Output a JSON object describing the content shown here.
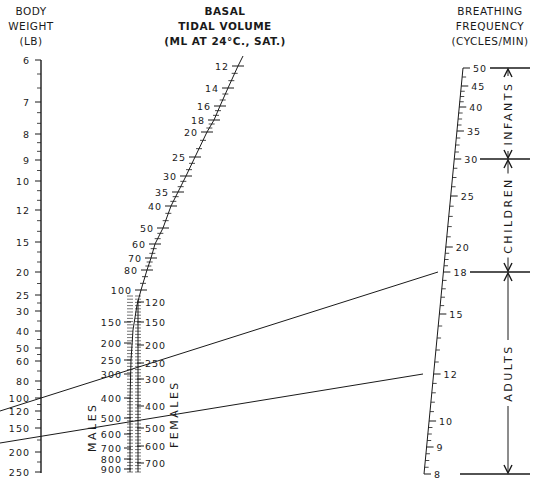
{
  "chart_data": {
    "type": "nomogram",
    "axes": [
      {
        "name": "Body Weight",
        "label_lines": [
          "BODY",
          "WEIGHT",
          "(LB)"
        ],
        "scale": "log",
        "ticks": [
          6,
          7,
          8,
          9,
          10,
          12,
          15,
          20,
          25,
          30,
          40,
          50,
          60,
          80,
          100,
          120,
          150,
          200,
          250
        ]
      },
      {
        "name": "Basal Tidal Volume",
        "label_lines": [
          "BASAL",
          "TIDAL VOLUME",
          "(ML AT 24°C., SAT.)"
        ],
        "scale": "curved",
        "ticks_common": [
          12,
          14,
          16,
          18,
          20,
          25,
          30,
          35,
          40,
          50,
          60,
          70,
          80,
          100
        ],
        "ticks_males": [
          120,
          150,
          200,
          250,
          300,
          400,
          500,
          600,
          700,
          800,
          900
        ],
        "ticks_females": [
          120,
          150,
          200,
          250,
          300,
          400,
          500,
          600,
          700
        ],
        "side_labels": {
          "males": "MALES",
          "females": "FEMALES"
        }
      },
      {
        "name": "Breathing Frequency",
        "label_lines": [
          "BREATHING",
          "FREQUENCY",
          "(CYCLES/MIN)"
        ],
        "scale": "log",
        "ticks": [
          50,
          45,
          40,
          35,
          30,
          25,
          20,
          18,
          15,
          12,
          10,
          9,
          8
        ]
      }
    ],
    "ranges": [
      {
        "label": "INFANTS",
        "from": 30,
        "to": 50
      },
      {
        "label": "CHILDREN",
        "from": 18,
        "to": 30
      },
      {
        "label": "ADULTS",
        "from": 8,
        "to": 18
      }
    ],
    "example_lines": [
      {
        "body_weight_lb": 120,
        "tidal_volume_ml": 300,
        "sex": "females",
        "frequency": 18
      },
      {
        "body_weight_lb": 170,
        "tidal_volume_ml": 550,
        "sex": "males",
        "frequency": 12
      }
    ],
    "grid": false,
    "legend": "none"
  },
  "headers": {
    "weight": [
      "BODY",
      "WEIGHT",
      "(LB)"
    ],
    "tidal": [
      "BASAL",
      "TIDAL VOLUME",
      "(ML AT 24°C., SAT.)"
    ],
    "freq": [
      "BREATHING",
      "FREQUENCY",
      "(CYCLES/MIN)"
    ]
  },
  "weight_ticks": [
    {
      "v": "6",
      "y": 60
    },
    {
      "v": "7",
      "y": 102
    },
    {
      "v": "8",
      "y": 134
    },
    {
      "v": "9",
      "y": 160
    },
    {
      "v": "10",
      "y": 181
    },
    {
      "v": "12",
      "y": 210
    },
    {
      "v": "15",
      "y": 242
    },
    {
      "v": "20",
      "y": 272
    },
    {
      "v": "25",
      "y": 295
    },
    {
      "v": "30",
      "y": 311
    },
    {
      "v": "40",
      "y": 331
    },
    {
      "v": "50",
      "y": 348
    },
    {
      "v": "60",
      "y": 361
    },
    {
      "v": "80",
      "y": 381
    },
    {
      "v": "100",
      "y": 398
    },
    {
      "v": "120",
      "y": 411
    },
    {
      "v": "150",
      "y": 428
    },
    {
      "v": "200",
      "y": 452
    },
    {
      "v": "250",
      "y": 472
    }
  ],
  "tidal_common_ticks": [
    {
      "v": "12",
      "x": 238,
      "y": 66
    },
    {
      "v": "14",
      "x": 228,
      "y": 88
    },
    {
      "v": "16",
      "x": 220,
      "y": 106
    },
    {
      "v": "18",
      "x": 214,
      "y": 120
    },
    {
      "v": "20",
      "x": 207,
      "y": 132
    },
    {
      "v": "25",
      "x": 195,
      "y": 157
    },
    {
      "v": "30",
      "x": 186,
      "y": 176
    },
    {
      "v": "35",
      "x": 178,
      "y": 192
    },
    {
      "v": "40",
      "x": 171,
      "y": 206
    },
    {
      "v": "50",
      "x": 163,
      "y": 228
    },
    {
      "v": "60",
      "x": 155,
      "y": 244
    },
    {
      "v": "70",
      "x": 151,
      "y": 258
    },
    {
      "v": "80",
      "x": 147,
      "y": 270
    },
    {
      "v": "100",
      "x": 141,
      "y": 290
    }
  ],
  "tidal_male_ticks": [
    {
      "v": "150",
      "y": 322
    },
    {
      "v": "200",
      "y": 343
    },
    {
      "v": "250",
      "y": 360
    },
    {
      "v": "300",
      "y": 374
    },
    {
      "v": "400",
      "y": 398
    },
    {
      "v": "500",
      "y": 418
    },
    {
      "v": "600",
      "y": 434
    },
    {
      "v": "700",
      "y": 448
    },
    {
      "v": "800",
      "y": 459
    },
    {
      "v": "900",
      "y": 469
    }
  ],
  "tidal_female_ticks": [
    {
      "v": "120",
      "y": 302
    },
    {
      "v": "150",
      "y": 322
    },
    {
      "v": "200",
      "y": 345
    },
    {
      "v": "250",
      "y": 363
    },
    {
      "v": "300",
      "y": 379
    },
    {
      "v": "400",
      "y": 406
    },
    {
      "v": "500",
      "y": 428
    },
    {
      "v": "600",
      "y": 446
    },
    {
      "v": "700",
      "y": 463
    }
  ],
  "freq_ticks": [
    {
      "v": "50",
      "x": 470,
      "y": 68
    },
    {
      "v": "45",
      "x": 467,
      "y": 86
    },
    {
      "v": "40",
      "x": 464,
      "y": 107
    },
    {
      "v": "35",
      "x": 460,
      "y": 131
    },
    {
      "v": "30",
      "x": 455,
      "y": 159
    },
    {
      "v": "25",
      "x": 450,
      "y": 196
    },
    {
      "v": "20",
      "x": 443,
      "y": 247
    },
    {
      "v": "18",
      "x": 437,
      "y": 272
    },
    {
      "v": "15",
      "x": 432,
      "y": 314
    },
    {
      "v": "12",
      "x": 423,
      "y": 374
    },
    {
      "v": "10",
      "x": 417,
      "y": 421
    },
    {
      "v": "9",
      "x": 414,
      "y": 447
    },
    {
      "v": "8",
      "x": 410,
      "y": 474
    }
  ],
  "range_labels": {
    "infants": "INFANTS",
    "children": "CHILDREN",
    "adults": "ADULTS"
  },
  "side_labels": {
    "males": "MALES",
    "females": "FEMALES"
  },
  "colors": {
    "ink": "#1a1a1a",
    "background": "#ffffff"
  }
}
